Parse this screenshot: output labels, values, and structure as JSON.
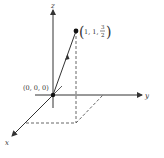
{
  "diagram": {
    "type": "3d-coordinate-axes",
    "axes": {
      "x": {
        "label": "x"
      },
      "y": {
        "label": "y"
      },
      "z": {
        "label": "z"
      }
    },
    "origin": {
      "label": "(0, 0, 0)"
    },
    "point": {
      "label_prefix": "1, 1, ",
      "frac_num": "3",
      "frac_den": "2",
      "coords": [
        1,
        1,
        1.5
      ]
    },
    "vector": {
      "from": "(0, 0, 0)",
      "to": "(1, 1, 3/2)"
    },
    "colors": {
      "line": "#333333",
      "dashed": "#555555",
      "background": "#ffffff"
    }
  }
}
